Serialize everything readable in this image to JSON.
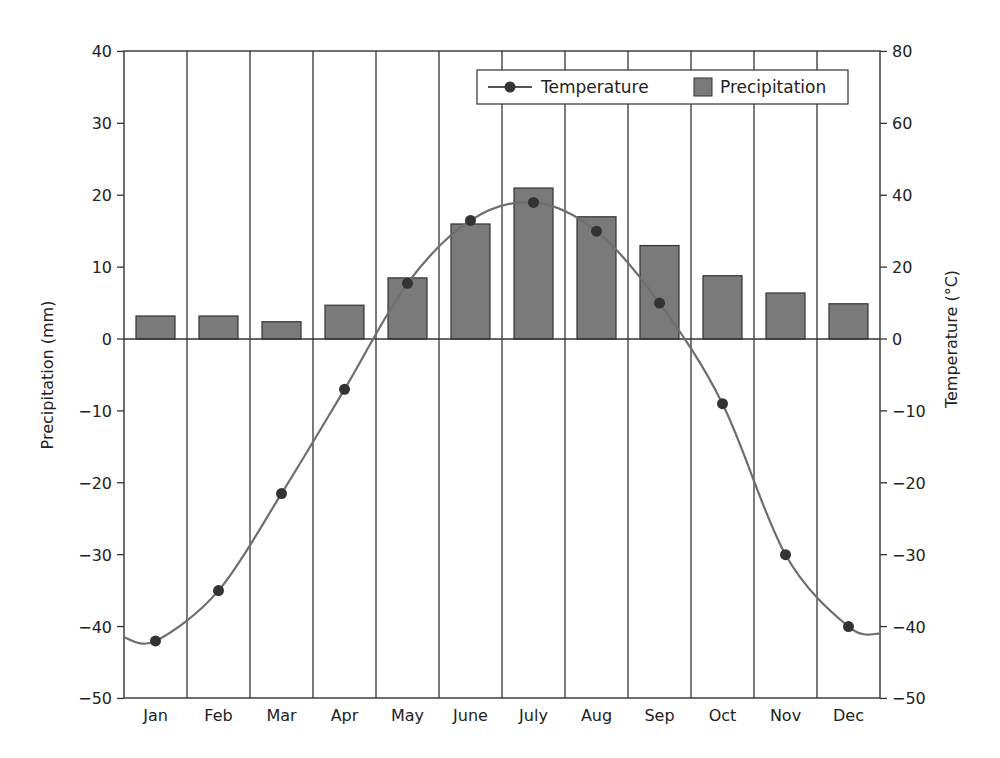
{
  "chart_data": {
    "type": "bar+line",
    "title": "",
    "categories": [
      "Jan",
      "Feb",
      "Mar",
      "Apr",
      "May",
      "June",
      "July",
      "Aug",
      "Sep",
      "Oct",
      "Nov",
      "Dec"
    ],
    "series": [
      {
        "name": "Precipitation",
        "type": "bar",
        "axis": "left",
        "color": "#7a7a7a",
        "values": [
          3.2,
          3.2,
          2.4,
          4.7,
          8.5,
          16,
          21,
          17,
          13,
          8.8,
          6.4,
          4.9
        ]
      },
      {
        "name": "Temperature",
        "type": "line",
        "axis": "right",
        "color": "#6e6e6e",
        "marker_color": "#333333",
        "values": [
          -42,
          -35,
          -21.5,
          -7,
          15.5,
          33,
          38,
          30,
          10,
          -9,
          -30,
          -40
        ]
      }
    ],
    "ylabel": "Precipitation (mm)",
    "y2label": "Temperature (°C)",
    "ylim": [
      -50,
      40
    ],
    "yticks": [
      40,
      30,
      20,
      10,
      0,
      -10,
      -20,
      -30,
      -40,
      -50
    ],
    "y2ticks": [
      80,
      60,
      40,
      20,
      0,
      -10,
      -20,
      -30,
      -40,
      -50
    ],
    "y2_note": "Right axis scale: 20 units per gridstep above 0, 10 units per step below 0",
    "legend": {
      "position": "upper right",
      "entries": [
        "Temperature",
        "Precipitation"
      ]
    },
    "grid": "vertical lines between months"
  },
  "labels": {
    "ylabel": "Precipitation (mm)",
    "y2label": "Temperature (°C)",
    "legend_temp": "Temperature",
    "legend_precip": "Precipitation"
  }
}
